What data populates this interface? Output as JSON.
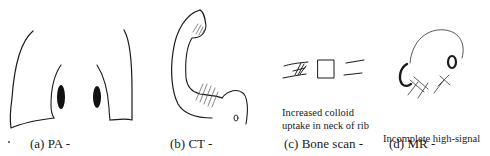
{
  "figure": {
    "panels": [
      {
        "id": "a",
        "caption": "(a) PA -",
        "subject": "chest-radiograph-sketch",
        "annotation": []
      },
      {
        "id": "b",
        "caption": "(b)  CT -",
        "subject": "rib-ct-sketch",
        "annotation": []
      },
      {
        "id": "c",
        "caption": "(c) Bone scan -",
        "subject": "bone-scan-sketch",
        "annotation": [
          "Increased colloid",
          "uptake in neck of rib"
        ]
      },
      {
        "id": "d",
        "caption": "(d) MR -",
        "subject": "mr-sketch",
        "annotation": [
          "Incomplete high-signal",
          " ring and mass"
        ]
      }
    ],
    "colors": {
      "ink": "#1a1a1a",
      "background": "#ffffff"
    }
  }
}
